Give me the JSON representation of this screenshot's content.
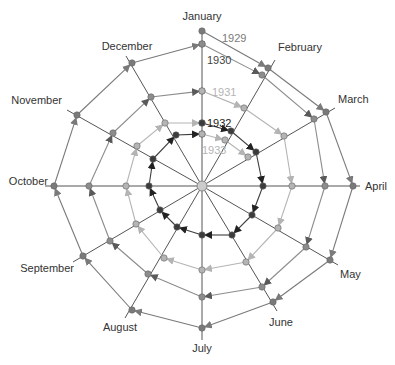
{
  "chart_data": {
    "type": "line",
    "subtype": "spiral-radial",
    "title": "",
    "center": [
      202,
      186
    ],
    "months": [
      "January",
      "February",
      "March",
      "April",
      "May",
      "June",
      "July",
      "August",
      "September",
      "October",
      "November",
      "December"
    ],
    "spoke_ends": [
      [
        202,
        28
      ],
      [
        275,
        60
      ],
      [
        335,
        108
      ],
      [
        360,
        186
      ],
      [
        338,
        265
      ],
      [
        277,
        311
      ],
      [
        202,
        340
      ],
      [
        125,
        318
      ],
      [
        73,
        262
      ],
      [
        45,
        186
      ],
      [
        67,
        110
      ],
      [
        126,
        56
      ]
    ],
    "label_positions": [
      {
        "x": 202,
        "y": 20,
        "anchor": "middle"
      },
      {
        "x": 278,
        "y": 51,
        "anchor": "start"
      },
      {
        "x": 338,
        "y": 103,
        "anchor": "start"
      },
      {
        "x": 365,
        "y": 190,
        "anchor": "start"
      },
      {
        "x": 340,
        "y": 278,
        "anchor": "start"
      },
      {
        "x": 281,
        "y": 326,
        "anchor": "middle"
      },
      {
        "x": 202,
        "y": 352,
        "anchor": "middle"
      },
      {
        "x": 120,
        "y": 331,
        "anchor": "middle"
      },
      {
        "x": 74,
        "y": 272,
        "anchor": "end"
      },
      {
        "x": 48,
        "y": 185,
        "anchor": "end"
      },
      {
        "x": 62,
        "y": 104,
        "anchor": "end"
      },
      {
        "x": 127,
        "y": 50,
        "anchor": "middle"
      }
    ],
    "series": [
      {
        "name": "1929",
        "color": "#7a7a7a",
        "label_pos": [
          222,
          42
        ],
        "points": [
          [
            202,
            31
          ],
          [
            268,
            68
          ],
          [
            326,
            112
          ],
          [
            353,
            186
          ],
          [
            330,
            260
          ],
          [
            273,
            302
          ],
          [
            202,
            328
          ],
          [
            132,
            310
          ],
          [
            83,
            256
          ],
          [
            54,
            186
          ],
          [
            77,
            115
          ],
          [
            132,
            63
          ],
          [
            202,
            44
          ]
        ]
      },
      {
        "name": "1930",
        "color": "#8c8c8c",
        "label_color": "#444444",
        "label_pos": [
          207,
          64
        ],
        "points": [
          [
            202,
            44
          ],
          [
            262,
            75
          ],
          [
            314,
            119
          ],
          [
            325,
            186
          ],
          [
            306,
            247
          ],
          [
            262,
            287
          ],
          [
            202,
            297
          ],
          [
            148,
            274
          ],
          [
            110,
            241
          ],
          [
            89,
            186
          ],
          [
            113,
            133
          ],
          [
            151,
            97
          ],
          [
            202,
            91
          ]
        ]
      },
      {
        "name": "1931",
        "color": "#b4b4b4",
        "label_pos": [
          212,
          96
        ],
        "points": [
          [
            202,
            91
          ],
          [
            244,
            108
          ],
          [
            284,
            136
          ],
          [
            292,
            186
          ],
          [
            278,
            228
          ],
          [
            246,
            262
          ],
          [
            202,
            270
          ],
          [
            164,
            258
          ],
          [
            136,
            224
          ],
          [
            126,
            186
          ],
          [
            137,
            146
          ],
          [
            165,
            123
          ],
          [
            202,
            123
          ]
        ]
      },
      {
        "name": "1932",
        "color": "#3c3c3c",
        "label_color": "#222222",
        "label_pos": [
          207,
          127
        ],
        "points": [
          [
            202,
            123
          ],
          [
            231,
            131
          ],
          [
            256,
            152
          ],
          [
            263,
            186
          ],
          [
            252,
            215
          ],
          [
            232,
            235
          ],
          [
            202,
            235
          ],
          [
            177,
            227
          ],
          [
            160,
            210
          ],
          [
            149,
            186
          ],
          [
            153,
            159
          ],
          [
            176,
            135
          ],
          [
            202,
            134
          ]
        ]
      },
      {
        "name": "1933",
        "color": "#b4b4b4",
        "label_pos": [
          202,
          154
        ],
        "points": [
          [
            202,
            134
          ],
          [
            225,
            140
          ],
          [
            248,
            157
          ]
        ]
      }
    ],
    "center_marker_color": "#cccccc"
  }
}
